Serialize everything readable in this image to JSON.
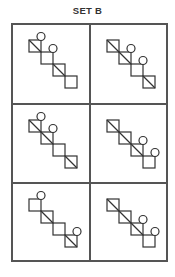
{
  "title": "SET B",
  "grid": {
    "rows": 3,
    "cols": 2
  },
  "step": 12,
  "cells": [
    {
      "id": 1,
      "origin": [
        16,
        15
      ],
      "squares": [
        [
          0,
          0
        ],
        [
          1,
          1
        ],
        [
          2,
          2
        ],
        [
          3,
          3
        ]
      ],
      "diagonals": [
        0,
        2
      ],
      "circles": [
        0,
        1
      ]
    },
    {
      "id": 2,
      "origin": [
        16,
        15
      ],
      "squares": [
        [
          0,
          0
        ],
        [
          1,
          1
        ],
        [
          2,
          2
        ],
        [
          3,
          3
        ]
      ],
      "diagonals": [
        0,
        1,
        3
      ],
      "circles": [
        1,
        2
      ]
    },
    {
      "id": 3,
      "origin": [
        16,
        15
      ],
      "squares": [
        [
          0,
          0
        ],
        [
          1,
          1
        ],
        [
          2,
          2
        ],
        [
          3,
          3
        ]
      ],
      "diagonals": [
        0,
        1,
        3
      ],
      "circles": [
        0,
        1
      ]
    },
    {
      "id": 4,
      "origin": [
        16,
        15
      ],
      "squares": [
        [
          0,
          0
        ],
        [
          1,
          1
        ],
        [
          2,
          2
        ],
        [
          3,
          3
        ]
      ],
      "diagonals": [
        0,
        1,
        2
      ],
      "circles": [
        2,
        3
      ]
    },
    {
      "id": 5,
      "origin": [
        16,
        15
      ],
      "squares": [
        [
          0,
          0
        ],
        [
          1,
          1
        ],
        [
          2,
          2
        ],
        [
          3,
          3
        ]
      ],
      "diagonals": [
        1,
        3
      ],
      "circles": [
        0,
        3
      ]
    },
    {
      "id": 6,
      "origin": [
        16,
        15
      ],
      "squares": [
        [
          0,
          0
        ],
        [
          1,
          1
        ],
        [
          2,
          2
        ],
        [
          3,
          3
        ]
      ],
      "diagonals": [
        0,
        1,
        2
      ],
      "circles": [
        2,
        3
      ]
    }
  ]
}
